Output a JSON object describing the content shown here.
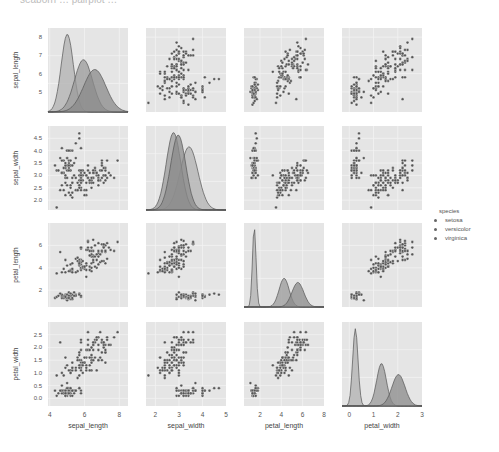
{
  "header": {
    "cropped_text": "seaborn … pairplot …"
  },
  "chart_data": {
    "type": "pairplot",
    "variables": [
      "sepal_length",
      "sepal_width",
      "petal_length",
      "petal_width"
    ],
    "hue": "species",
    "legend": {
      "title": "species",
      "entries": [
        "setosa",
        "versicolor",
        "virginica"
      ],
      "position": "right"
    },
    "diag_kind": "kde",
    "offdiag_kind": "scatter",
    "style": {
      "background": "#e5e5e5",
      "grid_color": "#f2f2f2",
      "point_color": "#555555",
      "kde_fill": [
        "#b0b0b0",
        "#9a9a9a",
        "#8a8a8a"
      ],
      "kde_line": "#555555"
    },
    "axes": {
      "sepal_length": {
        "label": "sepal_length",
        "range": [
          3.9,
          8.5
        ],
        "ticks": [
          4,
          6,
          8
        ],
        "ytick_labels": [
          5,
          6,
          7,
          8
        ]
      },
      "sepal_width": {
        "label": "sepal_width",
        "range": [
          1.6,
          5.0
        ],
        "ticks": [
          2,
          3,
          4,
          5
        ],
        "ytick_labels": [
          2.0,
          2.5,
          3.0,
          3.5,
          4.0,
          4.5
        ]
      },
      "petal_length": {
        "label": "petal_length",
        "range": [
          0.5,
          8.0
        ],
        "ticks": [
          2,
          4,
          6,
          8
        ],
        "ytick_labels": [
          2,
          4,
          6
        ]
      },
      "petal_width": {
        "label": "petal_width",
        "range": [
          -0.3,
          3.0
        ],
        "ticks": [
          0,
          1,
          2,
          3
        ],
        "ytick_labels": [
          0.0,
          0.5,
          1.0,
          1.5,
          2.0,
          2.5
        ]
      }
    },
    "species_stats": {
      "setosa": {
        "mean": [
          5.01,
          3.43,
          1.46,
          0.25
        ],
        "sd": [
          0.35,
          0.38,
          0.17,
          0.11
        ]
      },
      "versicolor": {
        "mean": [
          5.94,
          2.77,
          4.26,
          1.33
        ],
        "sd": [
          0.52,
          0.31,
          0.47,
          0.2
        ]
      },
      "virginica": {
        "mean": [
          6.59,
          2.97,
          5.55,
          2.03
        ],
        "sd": [
          0.64,
          0.32,
          0.55,
          0.27
        ]
      }
    },
    "n_per_species": 50
  },
  "layout": {
    "cols_x": [
      48,
      146,
      244,
      342
    ],
    "rows_y": [
      28,
      126,
      223,
      322
    ],
    "panel_w": 80,
    "panel_h": 84
  }
}
